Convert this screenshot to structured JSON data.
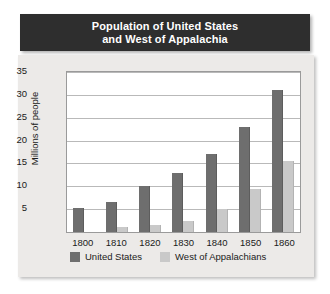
{
  "title": {
    "line1": "Population of United States",
    "line2": "and West of Appalachia"
  },
  "colors": {
    "title_bar": "#2e2e2e",
    "panel": "#eceae8",
    "plot": "#ffffff",
    "united_states": "#6e6e6e",
    "west_of_appalachians": "#c9c9c9",
    "gridline": "#b9b9b9"
  },
  "legend": {
    "position": "bottom-left",
    "items": [
      {
        "label": "United States",
        "color": "#6e6e6e"
      },
      {
        "label": "West of Appalachians",
        "color": "#c9c9c9"
      }
    ]
  },
  "chart_data": {
    "type": "bar",
    "title": "Population of United States and West of Appalachia",
    "xlabel": "",
    "ylabel": "Millions of people",
    "categories": [
      "1800",
      "1810",
      "1820",
      "1830",
      "1840",
      "1850",
      "1860"
    ],
    "yticks": [
      5,
      10,
      15,
      20,
      25,
      30,
      35
    ],
    "ylim": [
      0,
      35
    ],
    "grid": true,
    "series": [
      {
        "name": "United States",
        "color": "#6e6e6e",
        "values": [
          5.3,
          6.5,
          10,
          13,
          17,
          23,
          31
        ]
      },
      {
        "name": "West of Appalachians",
        "color": "#c9c9c9",
        "values": [
          0,
          1,
          1.5,
          2.5,
          5,
          9.5,
          15.5
        ]
      }
    ]
  }
}
